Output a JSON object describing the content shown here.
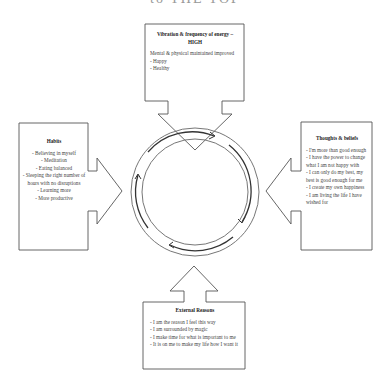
{
  "title": "to THE TOP",
  "center": {
    "shape": "cycle-ring",
    "arrows": 4,
    "direction": "clockwise"
  },
  "boxes": {
    "top": {
      "title": "Vibration & frequency of energy – HIGH",
      "intro": "Mental & physical maintained improved",
      "items": [
        "- Happy",
        "- Healthy"
      ]
    },
    "left": {
      "title": "Habits",
      "items": [
        "- Believing in myself",
        "- Meditation",
        "- Eating balanced",
        "- Sleeping the right number of hours with no disruptions",
        "- Learning more",
        "- More productive"
      ]
    },
    "right": {
      "title": "Thoughts & beliefs",
      "items": [
        "- I'm more than good enough",
        "- I have the power to change what I am not happy with",
        "- I can only do my best, my best is good enough for me",
        "- I create my own happiness",
        "- I am living the life I have wished for"
      ]
    },
    "bottom": {
      "title": "External Reasons",
      "items": [
        "- I am the reason I feel this way",
        "- I am surrounded by magic",
        "- I make time for what is important to me",
        "- It is on me to make my life how I want it"
      ]
    }
  },
  "colors": {
    "stroke": "#555555",
    "arrow_dark": "#333333",
    "background": "#ffffff"
  }
}
